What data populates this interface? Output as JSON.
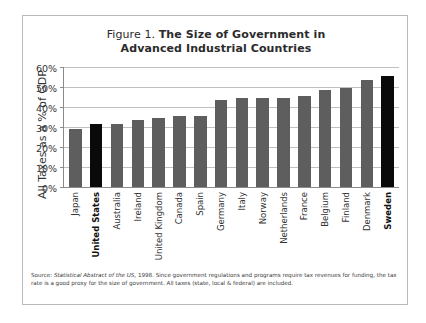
{
  "figure": {
    "title_prefix": "Figure 1. ",
    "title_main_line1": "The Size of Government in",
    "title_main_line2": "Advanced Industrial Countries",
    "source_label": "Source: ",
    "source_work": "Statistical Abstract of the US",
    "source_rest": ", 1998.  Since government regulations and programs require tax revenues for funding, the tax rate is a good proxy for the size of government.  All taxes (state, local & federal) are included."
  },
  "colors": {
    "bar_default": "#5e5e5e",
    "bar_highlight": "#0a0a0a",
    "gridline": "#c0c0c0",
    "axis": "#8a8a8a",
    "frame": "#b9b9b9",
    "background": "#ffffff"
  },
  "chart_data": {
    "type": "bar",
    "title": "Figure 1. The Size of Government in Advanced Industrial Countries",
    "xlabel": "",
    "ylabel": "All Taxes as a % of GDP",
    "ylim": [
      0,
      60
    ],
    "ytick_values": [
      0,
      10,
      20,
      30,
      40,
      50,
      60
    ],
    "ytick_labels": [
      "0%",
      "10%",
      "20%",
      "30%",
      "40%",
      "50%",
      "60%"
    ],
    "grid": true,
    "legend": false,
    "highlighted": [
      "United States",
      "Sweden"
    ],
    "categories": [
      "Japan",
      "United States",
      "Australia",
      "Ireland",
      "United Kingdom",
      "Canada",
      "Spain",
      "Germany",
      "Italy",
      "Norway",
      "Netherlands",
      "France",
      "Belgium",
      "Finland",
      "Denmark",
      "Sweden"
    ],
    "values": [
      29,
      32,
      32,
      34,
      35,
      36,
      36,
      44,
      45,
      45,
      45,
      46,
      49,
      50,
      54,
      56
    ],
    "units": "% of GDP",
    "note": "Source: Statistical Abstract of the US, 1998. Since government regulations and programs require tax revenues for funding, the tax rate is a good proxy for the size of government. All taxes (state, local & federal) are included."
  }
}
